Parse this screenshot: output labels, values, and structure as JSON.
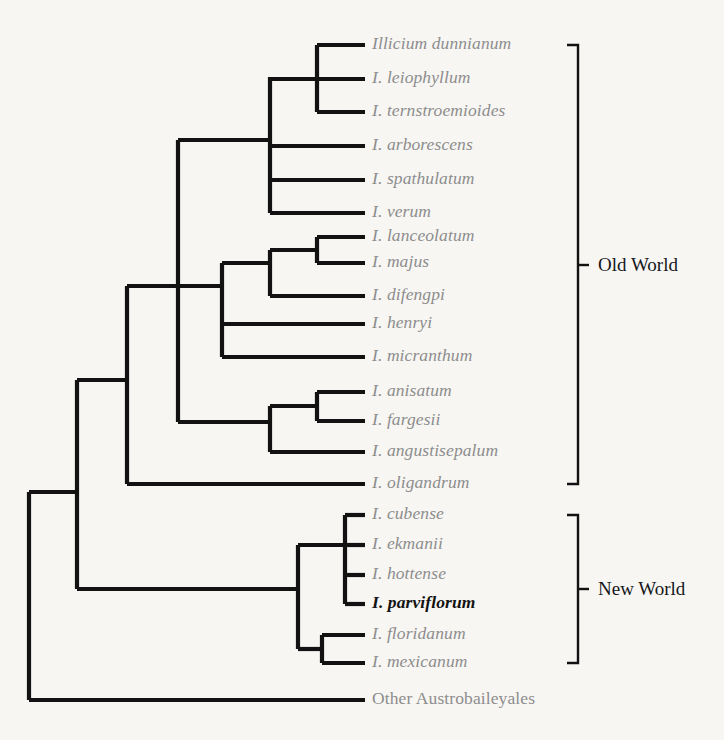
{
  "figure": {
    "type": "phylogenetic-cladogram",
    "width": 724,
    "height": 740,
    "background_color": "#f7f6f3",
    "branch_color": "#121212",
    "tip_label_color": "#8d8d8d",
    "focal_label_color": "#121212",
    "clade_label_color": "#16161a"
  },
  "tips": [
    {
      "id": "dunnianum",
      "label": "Illicium dunnianum",
      "y": 45,
      "style": "italic-gray",
      "clade": "Old World"
    },
    {
      "id": "leiophyllum",
      "label": "I. leiophyllum",
      "y": 79,
      "style": "italic-gray",
      "clade": "Old World"
    },
    {
      "id": "ternstroemioides",
      "label": "I. ternstroemioides",
      "y": 112,
      "style": "italic-gray",
      "clade": "Old World"
    },
    {
      "id": "arborescens",
      "label": "I. arborescens",
      "y": 146,
      "style": "italic-gray",
      "clade": "Old World"
    },
    {
      "id": "spathulatum",
      "label": "I. spathulatum",
      "y": 180,
      "style": "italic-gray",
      "clade": "Old World"
    },
    {
      "id": "verum",
      "label": "I. verum",
      "y": 213,
      "style": "italic-gray",
      "clade": "Old World"
    },
    {
      "id": "lanceolatum",
      "label": "I. lanceolatum",
      "y": 237,
      "style": "italic-gray",
      "clade": "Old World"
    },
    {
      "id": "majus",
      "label": "I. majus",
      "y": 263,
      "style": "italic-gray",
      "clade": "Old World"
    },
    {
      "id": "difengpi",
      "label": "I. difengpi",
      "y": 296,
      "style": "italic-gray",
      "clade": "Old World"
    },
    {
      "id": "henryi",
      "label": "I. henryi",
      "y": 324,
      "style": "italic-gray",
      "clade": "Old World"
    },
    {
      "id": "micranthum",
      "label": "I. micranthum",
      "y": 357,
      "style": "italic-gray",
      "clade": "Old World"
    },
    {
      "id": "anisatum",
      "label": "I. anisatum",
      "y": 392,
      "style": "italic-gray",
      "clade": "Old World"
    },
    {
      "id": "fargesii",
      "label": "I. fargesii",
      "y": 421,
      "style": "italic-gray",
      "clade": "Old World"
    },
    {
      "id": "angustisepalum",
      "label": "I. angustisepalum",
      "y": 452,
      "style": "italic-gray",
      "clade": "Old World"
    },
    {
      "id": "oligandrum",
      "label": "I. oligandrum",
      "y": 484,
      "style": "italic-gray",
      "clade": "Old World"
    },
    {
      "id": "cubense",
      "label": "I. cubense",
      "y": 515,
      "style": "italic-gray",
      "clade": "New World"
    },
    {
      "id": "ekmanii",
      "label": "I. ekmanii",
      "y": 545,
      "style": "italic-gray",
      "clade": "New World"
    },
    {
      "id": "hottense",
      "label": "I. hottense",
      "y": 575,
      "style": "italic-gray",
      "clade": "New World"
    },
    {
      "id": "parviflorum",
      "label": "I. parviflorum",
      "y": 604,
      "style": "bold-italic-black",
      "clade": "New World"
    },
    {
      "id": "floridanum",
      "label": "I. floridanum",
      "y": 635,
      "style": "italic-gray",
      "clade": "New World"
    },
    {
      "id": "mexicanum",
      "label": "I. mexicanum",
      "y": 663,
      "style": "italic-gray",
      "clade": "New World"
    },
    {
      "id": "austrobaileyales",
      "label": "Other Austrobaileyales",
      "y": 700,
      "style": "roman-gray",
      "clade": "outgroup"
    }
  ],
  "clade_brackets": [
    {
      "id": "old-world",
      "label": "Old World",
      "y_top": 45,
      "y_bottom": 484,
      "label_y": 265
    },
    {
      "id": "new-world",
      "label": "New World",
      "y_top": 515,
      "y_bottom": 663,
      "label_y": 589
    }
  ],
  "geometry": {
    "tip_line_end_x": 365,
    "label_x": 372,
    "bracket_x": 578,
    "bracket_tick_len": 11,
    "bracket_label_x": 598,
    "stroke_width": 4.2
  }
}
